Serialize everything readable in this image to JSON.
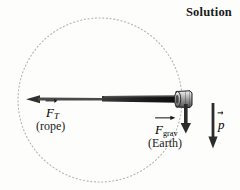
{
  "figure": {
    "title": "Solution",
    "background_color": "#fdfdfc",
    "ink_color": "#1a1a1a"
  },
  "diagram": {
    "type": "free-body-diagram",
    "orbit_circle": {
      "name": "circular-path",
      "center_x": 100,
      "center_y": 100,
      "radius": 82,
      "style": "dotted",
      "color": "#b9b2a6"
    },
    "rope": {
      "name": "rope-line",
      "from_x": 26,
      "to_x": 180,
      "y": 99,
      "color": "#111111"
    },
    "ball": {
      "name": "ball-object",
      "x": 184,
      "y": 99,
      "fill": "#9c9c9c",
      "stroke": "#1d1d1d"
    }
  },
  "vectors": {
    "tension": {
      "symbol": "F",
      "subscript": "T",
      "source_label": "(rope)",
      "direction": "left",
      "tip_x": 26,
      "tail_x": 180,
      "y": 99,
      "color": "#2b2b2b"
    },
    "gravity": {
      "symbol": "F",
      "subscript": "grav",
      "source_label": "(Earth)",
      "direction": "down",
      "x": 186,
      "from_y": 104,
      "to_y": 131,
      "color": "#2b2b2b"
    },
    "momentum": {
      "symbol": "p",
      "subscript": "",
      "source_label": "",
      "direction": "down",
      "x": 213,
      "from_y": 103,
      "to_y": 148,
      "color": "#2b2b2b"
    }
  }
}
